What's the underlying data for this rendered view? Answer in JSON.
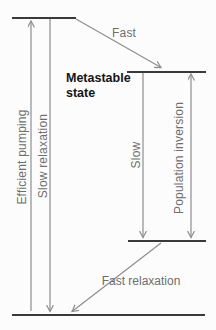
{
  "diagram": {
    "type": "energy-level-diagram",
    "labels": {
      "fast_decay": "Fast",
      "metastable_state": "Metastable state",
      "efficient_pumping": "Efficient pumping",
      "slow_relaxation": "Slow relaxation",
      "slow_decay": "Slow",
      "population_inversion": "Population inversion",
      "fast_relaxation": "Fast relaxation"
    },
    "levels": [
      {
        "name": "upper-pump-level"
      },
      {
        "name": "metastable-level"
      },
      {
        "name": "intermediate-level"
      },
      {
        "name": "ground-level"
      }
    ],
    "colors": {
      "level_line": "#3a3a3a",
      "arrow_line": "#8e8e8e",
      "label_text": "#6e6e6e",
      "metastable_text": "#151515",
      "background": "#fcfcfc"
    }
  }
}
